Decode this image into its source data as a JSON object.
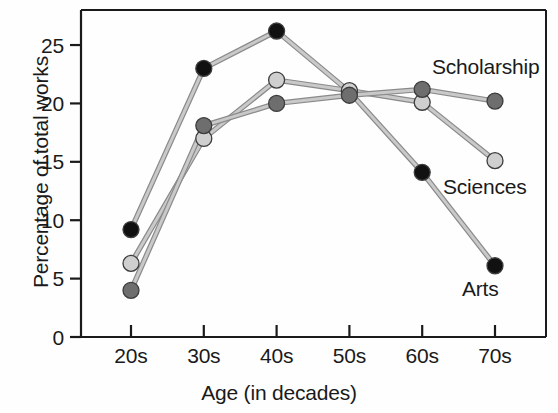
{
  "chart_data": {
    "type": "line",
    "title": "",
    "subtitle": "",
    "xlabel": "Age (in decades)",
    "ylabel": "Percentage of total works",
    "categories": [
      "20s",
      "30s",
      "40s",
      "50s",
      "60s",
      "70s"
    ],
    "x_tick_labels": [
      "20s",
      "30s",
      "40s",
      "50s",
      "60s",
      "70s"
    ],
    "y_tick_labels": [
      "0",
      "5",
      "10",
      "15",
      "20",
      "25"
    ],
    "y_ticks": [
      0,
      5,
      10,
      15,
      20,
      25
    ],
    "ylim": [
      0,
      28
    ],
    "xlim_categories": 6,
    "grid": false,
    "legend_position": "inline-right-annotations",
    "series": [
      {
        "name": "Arts",
        "marker": "filled-circle",
        "color": "#111111",
        "line_color": "#9a9a9a",
        "values": [
          9.2,
          23.0,
          26.2,
          21.0,
          14.1,
          6.1
        ]
      },
      {
        "name": "Sciences",
        "marker": "light-circle",
        "color": "#cfcfcf",
        "line_color": "#9a9a9a",
        "values": [
          6.3,
          17.0,
          22.0,
          21.1,
          20.1,
          15.1
        ]
      },
      {
        "name": "Scholarship",
        "marker": "dark-gray-circle",
        "color": "#6e6e6e",
        "line_color": "#9a9a9a",
        "values": [
          4.0,
          18.1,
          20.0,
          20.7,
          21.2,
          20.2
        ]
      }
    ],
    "annotations": [
      {
        "text": "Scholarship",
        "x": 432,
        "y": 74
      },
      {
        "text": "Sciences",
        "x": 443,
        "y": 194
      },
      {
        "text": "Arts",
        "x": 462,
        "y": 296
      }
    ],
    "colors": {
      "arts_marker": "#111111",
      "sciences_marker": "#cfcfcf",
      "scholarship_marker": "#6e6e6e",
      "line": "#9a9a9a",
      "axis": "#1a1a1a",
      "text": "#1a1a1a",
      "background": "#fefefe"
    }
  }
}
